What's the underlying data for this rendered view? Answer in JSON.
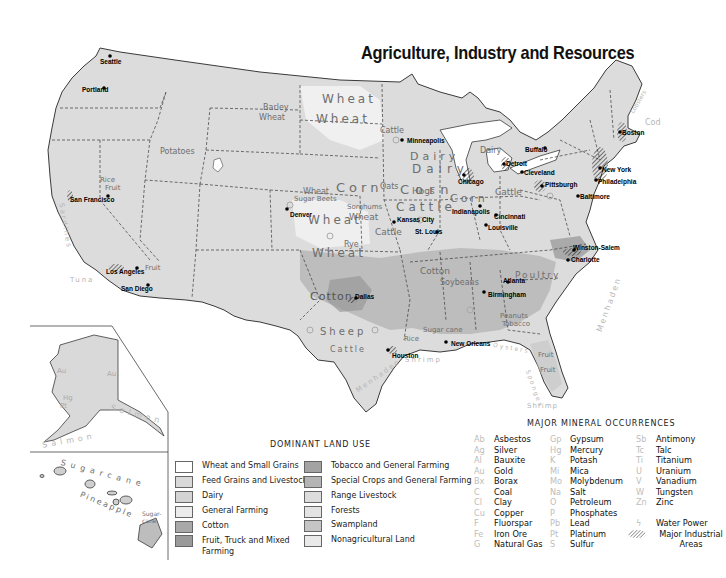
{
  "title": "Agriculture, Industry and Resources",
  "cities": [
    {
      "name": "Seattle",
      "x": 100,
      "y": 58
    },
    {
      "name": "Portland",
      "x": 82,
      "y": 86
    },
    {
      "name": "San Francisco",
      "x": 70,
      "y": 196
    },
    {
      "name": "Los Angeles",
      "x": 106,
      "y": 268
    },
    {
      "name": "San Diego",
      "x": 121,
      "y": 285
    },
    {
      "name": "Denver",
      "x": 290,
      "y": 213
    },
    {
      "name": "Minneapolis",
      "x": 410,
      "y": 140
    },
    {
      "name": "Chicago",
      "x": 468,
      "y": 176
    },
    {
      "name": "Detroit",
      "x": 506,
      "y": 162
    },
    {
      "name": "Buffalo",
      "x": 525,
      "y": 148
    },
    {
      "name": "Cleveland",
      "x": 524,
      "y": 169
    },
    {
      "name": "Pittsburgh",
      "x": 545,
      "y": 183
    },
    {
      "name": "Boston",
      "x": 624,
      "y": 131
    },
    {
      "name": "New York",
      "x": 603,
      "y": 169
    },
    {
      "name": "Philadelphia",
      "x": 600,
      "y": 181
    },
    {
      "name": "Baltimore",
      "x": 580,
      "y": 196
    },
    {
      "name": "Indianapolis",
      "x": 452,
      "y": 210
    },
    {
      "name": "Cincinnati",
      "x": 494,
      "y": 217
    },
    {
      "name": "Louisville",
      "x": 487,
      "y": 226
    },
    {
      "name": "Kansas City",
      "x": 397,
      "y": 226
    },
    {
      "name": "St. Louis",
      "x": 415,
      "y": 233
    },
    {
      "name": "Winston-Salem",
      "x": 573,
      "y": 253
    },
    {
      "name": "Charlotte",
      "x": 571,
      "y": 260
    },
    {
      "name": "Atlanta",
      "x": 503,
      "y": 282
    },
    {
      "name": "Birmingham",
      "x": 488,
      "y": 293
    },
    {
      "name": "Dallas",
      "x": 351,
      "y": 300
    },
    {
      "name": "Houston",
      "x": 392,
      "y": 354
    },
    {
      "name": "New Orleans",
      "x": 444,
      "y": 344
    }
  ],
  "crop_labels": [
    {
      "text": "Barley",
      "x": 263,
      "y": 106
    },
    {
      "text": "Wheat",
      "x": 259,
      "y": 117
    },
    {
      "text": "Wheat",
      "x": 322,
      "y": 96
    },
    {
      "text": "Wheat",
      "x": 316,
      "y": 117
    },
    {
      "text": "Potatoes",
      "x": 160,
      "y": 150
    },
    {
      "text": "Rice",
      "x": 50,
      "y": 176
    },
    {
      "text": "Fruit",
      "x": 105,
      "y": 197
    },
    {
      "text": "Sugar Beets",
      "x": 294,
      "y": 198
    },
    {
      "text": "Wheat",
      "x": 303,
      "y": 194
    },
    {
      "text": "Corn",
      "x": 340,
      "y": 190
    },
    {
      "text": "Sorghums",
      "x": 347,
      "y": 204
    },
    {
      "text": "Wheat",
      "x": 349,
      "y": 215
    },
    {
      "text": "Wheat",
      "x": 308,
      "y": 214
    },
    {
      "text": "Cattle",
      "x": 375,
      "y": 230
    },
    {
      "text": "Rye",
      "x": 344,
      "y": 245
    },
    {
      "text": "Wheat",
      "x": 312,
      "y": 252
    },
    {
      "text": "Dairy",
      "x": 406,
      "y": 146
    },
    {
      "text": "Cattle",
      "x": 380,
      "y": 136
    },
    {
      "text": "Dairy",
      "x": 470,
      "y": 170
    },
    {
      "text": "Corn",
      "x": 390,
      "y": 178
    },
    {
      "text": "Oats",
      "x": 385,
      "y": 180
    },
    {
      "text": "Hogs",
      "x": 410,
      "y": 185
    },
    {
      "text": "Cattle",
      "x": 425,
      "y": 196
    },
    {
      "text": "Corn",
      "x": 450,
      "y": 196
    },
    {
      "text": "Cattle",
      "x": 495,
      "y": 190
    },
    {
      "text": "Dairy",
      "x": 498,
      "y": 172
    },
    {
      "text": "Cotton",
      "x": 330,
      "y": 302
    },
    {
      "text": "Sheep",
      "x": 335,
      "y": 340
    },
    {
      "text": "Cattle",
      "x": 336,
      "y": 358
    },
    {
      "text": "Rice",
      "x": 404,
      "y": 340
    },
    {
      "text": "Sugar cane",
      "x": 423,
      "y": 332
    },
    {
      "text": "Cotton",
      "x": 427,
      "y": 269
    },
    {
      "text": "Soybeans",
      "x": 445,
      "y": 276
    },
    {
      "text": "Poultry",
      "x": 518,
      "y": 274
    },
    {
      "text": "Peanuts",
      "x": 500,
      "y": 315
    },
    {
      "text": "Tobacco",
      "x": 500,
      "y": 321
    },
    {
      "text": "Fruit",
      "x": 541,
      "y": 354
    },
    {
      "text": "Fruit",
      "x": 542,
      "y": 370
    },
    {
      "text": "Fruit",
      "x": 100,
      "y": 270
    }
  ],
  "sea_labels": [
    {
      "text": "Sardines",
      "x": 51,
      "y": 205,
      "rot": 80
    },
    {
      "text": "Tuna",
      "x": 73,
      "y": 285,
      "rot": 0
    },
    {
      "text": "Shrimp",
      "x": 405,
      "y": 360,
      "rot": 0
    },
    {
      "text": "Menhaden",
      "x": 363,
      "y": 375,
      "rot": -35
    },
    {
      "text": "Oysters",
      "x": 495,
      "y": 348,
      "rot": 10
    },
    {
      "text": "Sponges",
      "x": 520,
      "y": 385,
      "rot": 70
    },
    {
      "text": "Shrimp",
      "x": 527,
      "y": 404,
      "rot": 0
    },
    {
      "text": "Menhaden",
      "x": 596,
      "y": 300,
      "rot": -70
    },
    {
      "text": "Lobsters",
      "x": 635,
      "y": 100,
      "rot": -60
    },
    {
      "text": "Cod",
      "x": 646,
      "y": 122,
      "rot": 0
    },
    {
      "text": "Salmon",
      "x": 115,
      "y": 368,
      "rot": 15
    },
    {
      "text": "Salmon",
      "x": 48,
      "y": 434,
      "rot": -10
    }
  ],
  "inset": {
    "alaska_labels": [
      "Au",
      "Au",
      "Hg",
      "Pt"
    ],
    "hawaii_labels": {
      "sugarcane": "Sugarcane",
      "pineapple": "Pineapple",
      "sugarcane_short": "Sugar-cane"
    }
  },
  "land_use_legend": {
    "title": "DOMINANT LAND USE",
    "items": [
      {
        "label": "Wheat and Small Grains",
        "color": "#ffffff"
      },
      {
        "label": "Feed Grains and Livestock",
        "color": "#d9d9d9"
      },
      {
        "label": "Dairy",
        "color": "#d4d4d4"
      },
      {
        "label": "General Farming",
        "color": "#ececec"
      },
      {
        "label": "Cotton",
        "color": "#a9a9a9"
      },
      {
        "label": "Fruit, Truck and Mixed Farming",
        "color": "#9a9a9a"
      },
      {
        "label": "Tobacco and General Farming",
        "color": "#a3a3a3"
      },
      {
        "label": "Special Crops and General Farming",
        "color": "#b4b4b4"
      },
      {
        "label": "Range Livestock",
        "color": "#dcdcdc"
      },
      {
        "label": "Forests",
        "color": "#e3e3e3"
      },
      {
        "label": "Swampland",
        "color": "#c5c5c5"
      },
      {
        "label": "Nonagricultural Land",
        "color": "#e9e9e9"
      }
    ]
  },
  "mineral_legend": {
    "title": "MAJOR MINERAL OCCURRENCES",
    "columns": [
      [
        {
          "sym": "Ab",
          "name": "Asbestos"
        },
        {
          "sym": "Ag",
          "name": "Silver"
        },
        {
          "sym": "Al",
          "name": "Bauxite"
        },
        {
          "sym": "Au",
          "name": "Gold"
        },
        {
          "sym": "Bx",
          "name": "Borax"
        },
        {
          "sym": "C",
          "name": "Coal"
        },
        {
          "sym": "Cl",
          "name": "Clay"
        },
        {
          "sym": "Cu",
          "name": "Copper"
        },
        {
          "sym": "F",
          "name": "Fluorspar"
        },
        {
          "sym": "Fe",
          "name": "Iron Ore"
        },
        {
          "sym": "G",
          "name": "Natural Gas"
        }
      ],
      [
        {
          "sym": "Gp",
          "name": "Gypsum"
        },
        {
          "sym": "Hg",
          "name": "Mercury"
        },
        {
          "sym": "K",
          "name": "Potash"
        },
        {
          "sym": "Mi",
          "name": "Mica"
        },
        {
          "sym": "Mo",
          "name": "Molybdenum"
        },
        {
          "sym": "Na",
          "name": "Salt"
        },
        {
          "sym": "O",
          "name": "Petroleum"
        },
        {
          "sym": "P",
          "name": "Phosphates"
        },
        {
          "sym": "Pb",
          "name": "Lead"
        },
        {
          "sym": "Pt",
          "name": "Platinum"
        },
        {
          "sym": "S",
          "name": "Sulfur"
        }
      ],
      [
        {
          "sym": "Sb",
          "name": "Antimony"
        },
        {
          "sym": "Tc",
          "name": "Talc"
        },
        {
          "sym": "Ti",
          "name": "Titanium"
        },
        {
          "sym": "U",
          "name": "Uranium"
        },
        {
          "sym": "V",
          "name": "Vanadium"
        },
        {
          "sym": "W",
          "name": "Tungsten"
        },
        {
          "sym": "Zn",
          "name": "Zinc"
        }
      ]
    ],
    "extras": [
      {
        "name": "Water Power",
        "icon": "lightning-icon"
      },
      {
        "name": "Major Industrial Areas",
        "icon": "hatched-area-icon"
      }
    ]
  }
}
